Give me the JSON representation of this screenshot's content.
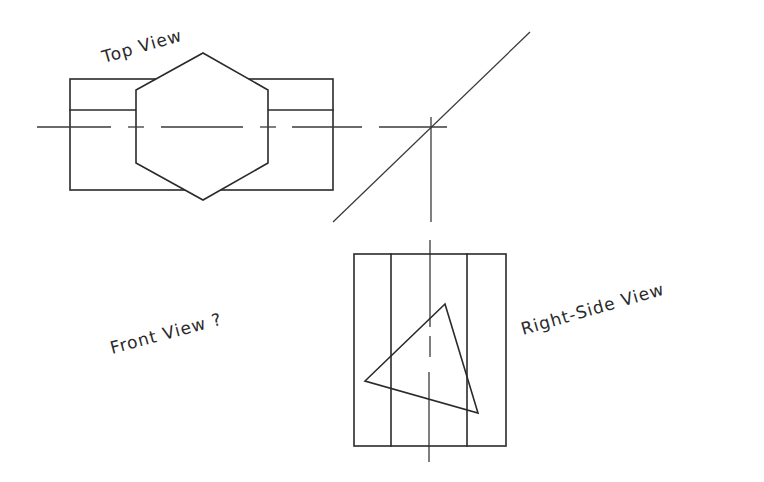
{
  "diagram": {
    "labels": {
      "top_view": "Top View",
      "front_view": "Front View ?",
      "right_side_view": "Right-Side View"
    },
    "colors": {
      "background": "#ffffff",
      "line": "#2a2a2a"
    },
    "top_view": {
      "rectangle": {
        "x1": 70,
        "y1": 79,
        "x2": 333,
        "y2": 190
      },
      "inner_line_y": 110,
      "hexagon": [
        [
          203,
          53
        ],
        [
          268,
          90
        ],
        [
          268,
          163
        ],
        [
          203,
          200
        ],
        [
          136,
          163
        ],
        [
          136,
          90
        ]
      ],
      "centerline_y": 127,
      "centerline_dashes": [
        [
          37,
          111
        ],
        [
          128,
          144
        ],
        [
          161,
          243
        ],
        [
          260,
          276
        ],
        [
          292,
          362
        ],
        [
          379,
          447
        ]
      ]
    },
    "miter_line": {
      "x1": 333,
      "y1": 222,
      "x2": 530,
      "y2": 32
    },
    "projection_vertical": {
      "x": 431,
      "segments": [
        [
          117,
          222
        ],
        [
          240,
          327
        ],
        [
          336,
          357
        ],
        [
          372,
          462
        ]
      ]
    },
    "right_side_view": {
      "rectangle": {
        "x1": 354,
        "y1": 254,
        "x2": 506,
        "y2": 446
      },
      "inner_lines_x": [
        391,
        467
      ],
      "triangle": [
        [
          445,
          304
        ],
        [
          365,
          381
        ],
        [
          478,
          413
        ]
      ]
    }
  }
}
